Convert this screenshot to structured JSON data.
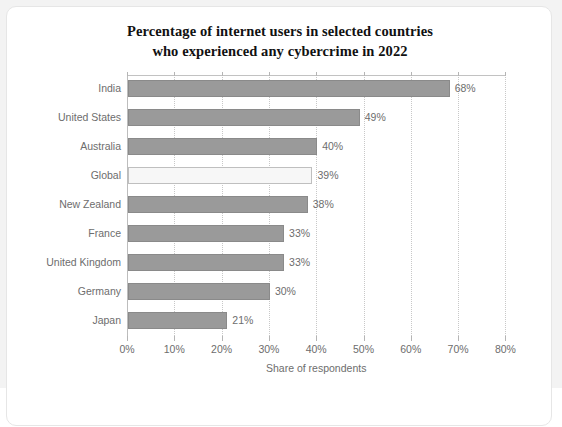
{
  "chart_data": {
    "type": "bar",
    "orientation": "horizontal",
    "title": "Percentage of internet users in selected countries who experienced any cybercrime in 2022",
    "title_lines": [
      "Percentage of internet users in selected countries",
      "who experienced any cybercrime in 2022"
    ],
    "xlabel": "Share of respondents",
    "ylabel": "",
    "xlim": [
      0,
      80
    ],
    "xticks": [
      0,
      10,
      20,
      30,
      40,
      50,
      60,
      70,
      80
    ],
    "xtick_labels": [
      "0%",
      "10%",
      "20%",
      "30%",
      "40%",
      "50%",
      "60%",
      "70%",
      "80%"
    ],
    "grid": "vertical-dotted",
    "legend": "none",
    "categories": [
      "India",
      "United States",
      "Australia",
      "Global",
      "New Zealand",
      "France",
      "United Kingdom",
      "Germany",
      "Japan"
    ],
    "values": [
      68,
      49,
      40,
      39,
      38,
      33,
      33,
      30,
      21
    ],
    "value_labels": [
      "68%",
      "49%",
      "40%",
      "39%",
      "38%",
      "33%",
      "33%",
      "30%",
      "21%"
    ],
    "highlight_category": "Global",
    "colors": {
      "bar_fill": "#9a9a9a",
      "bar_border": "#8a8a8a",
      "highlight_fill": "#f7f7f7",
      "highlight_border": "#bfbfbf",
      "gridline": "#c8c8c8",
      "axis": "#bdbdbd",
      "text": "#6d6d6d",
      "title_text": "#111111",
      "card_background": "#ffffff",
      "page_background": "#f3f3f3"
    }
  }
}
